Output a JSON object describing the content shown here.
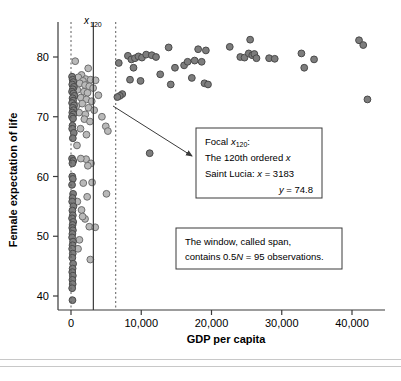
{
  "chart_data": {
    "type": "scatter",
    "title": "",
    "xlabel": "GDP per capita",
    "ylabel": "Female expectation of life",
    "xlim": [
      -2500,
      45500
    ],
    "ylim": [
      37.5,
      84
    ],
    "xticks": [
      0,
      10000,
      20000,
      30000,
      40000
    ],
    "xticklabels": [
      "0",
      "10,000",
      "20,000",
      "30,000",
      "40,000"
    ],
    "yticks": [
      40,
      50,
      60,
      70,
      80
    ],
    "yticklabels": [
      "40",
      "50",
      "60",
      "70",
      "80"
    ],
    "grid": false,
    "legend": "none",
    "focal_line_label": "x120",
    "focal_line_x": 3183,
    "span_lower_x": 0,
    "span_upper_x": 6366,
    "series": [
      {
        "name": "inside-span",
        "marker": "circle",
        "fill": "#b9b9b9",
        "edge": "#6e6e6e",
        "points": [
          [
            600,
            79.3
          ],
          [
            2450,
            78.1
          ],
          [
            1500,
            77.0
          ],
          [
            1050,
            76.6
          ],
          [
            2100,
            76.3
          ],
          [
            1700,
            76.0
          ],
          [
            2800,
            76.2
          ],
          [
            3500,
            76.1
          ],
          [
            1250,
            75.6
          ],
          [
            2000,
            75.3
          ],
          [
            2600,
            75.1
          ],
          [
            3150,
            74.8
          ],
          [
            900,
            74.5
          ],
          [
            1850,
            74.2
          ],
          [
            2350,
            74.0
          ],
          [
            3900,
            73.6
          ],
          [
            1400,
            73.2
          ],
          [
            2200,
            72.9
          ],
          [
            2950,
            72.6
          ],
          [
            1600,
            72.2
          ],
          [
            750,
            71.8
          ],
          [
            2500,
            71.5
          ],
          [
            3300,
            71.1
          ],
          [
            1150,
            70.7
          ],
          [
            2050,
            70.4
          ],
          [
            4400,
            70.0
          ],
          [
            1900,
            69.6
          ],
          [
            2700,
            69.2
          ],
          [
            4950,
            68.4
          ],
          [
            1350,
            68.0
          ],
          [
            5250,
            67.6
          ],
          [
            850,
            65.2
          ],
          [
            2150,
            62.9
          ],
          [
            2850,
            62.2
          ],
          [
            2400,
            61.8
          ],
          [
            1750,
            58.9
          ],
          [
            2300,
            56.6
          ],
          [
            5050,
            57.1
          ],
          [
            1500,
            54.4
          ],
          [
            2000,
            52.9
          ],
          [
            2600,
            51.6
          ],
          [
            3450,
            51.5
          ],
          [
            1200,
            49.4
          ],
          [
            2750,
            46.1
          ],
          [
            1000,
            47.9
          ],
          [
            1650,
            53.3
          ],
          [
            900,
            55.8
          ],
          [
            3000,
            59.0
          ],
          [
            1400,
            63.0
          ],
          [
            2200,
            67.0
          ]
        ]
      },
      {
        "name": "outside-span",
        "marker": "circle",
        "fill": "#7d7d7d",
        "edge": "#4a4a4a",
        "points": [
          [
            150,
            76.7
          ],
          [
            230,
            76.2
          ],
          [
            320,
            75.8
          ],
          [
            180,
            75.4
          ],
          [
            410,
            75.0
          ],
          [
            260,
            74.6
          ],
          [
            150,
            74.2
          ],
          [
            350,
            73.9
          ],
          [
            480,
            73.5
          ],
          [
            220,
            73.1
          ],
          [
            300,
            72.7
          ],
          [
            160,
            72.3
          ],
          [
            430,
            71.9
          ],
          [
            250,
            71.5
          ],
          [
            370,
            71.1
          ],
          [
            190,
            70.7
          ],
          [
            330,
            70.4
          ],
          [
            140,
            70.0
          ],
          [
            290,
            69.7
          ],
          [
            210,
            68.5
          ],
          [
            170,
            68.0
          ],
          [
            400,
            67.3
          ],
          [
            260,
            66.4
          ],
          [
            150,
            63.0
          ],
          [
            320,
            62.6
          ],
          [
            200,
            62.2
          ],
          [
            180,
            60.0
          ],
          [
            260,
            59.6
          ],
          [
            150,
            58.6
          ],
          [
            300,
            57.1
          ],
          [
            220,
            56.4
          ],
          [
            170,
            55.8
          ],
          [
            340,
            55.0
          ],
          [
            200,
            54.3
          ],
          [
            260,
            53.5
          ],
          [
            150,
            53.0
          ],
          [
            310,
            52.4
          ],
          [
            230,
            51.9
          ],
          [
            180,
            51.4
          ],
          [
            270,
            51.0
          ],
          [
            200,
            50.4
          ],
          [
            160,
            49.8
          ],
          [
            290,
            49.1
          ],
          [
            220,
            48.5
          ],
          [
            170,
            47.9
          ],
          [
            250,
            47.1
          ],
          [
            190,
            46.4
          ],
          [
            300,
            45.4
          ],
          [
            230,
            44.6
          ],
          [
            180,
            44.0
          ],
          [
            260,
            43.4
          ],
          [
            200,
            42.7
          ],
          [
            240,
            42.0
          ],
          [
            170,
            41.3
          ],
          [
            210,
            39.3
          ],
          [
            6800,
            79.0
          ],
          [
            7300,
            73.8
          ],
          [
            6950,
            73.5
          ],
          [
            6600,
            73.3
          ],
          [
            8100,
            80.2
          ],
          [
            8600,
            79.6
          ],
          [
            8900,
            78.2
          ],
          [
            9100,
            79.8
          ],
          [
            8400,
            76.2
          ],
          [
            9600,
            80.1
          ],
          [
            10100,
            79.9
          ],
          [
            9900,
            76.0
          ],
          [
            11200,
            63.9
          ],
          [
            10700,
            80.4
          ],
          [
            11500,
            80.3
          ],
          [
            12100,
            80.0
          ],
          [
            12700,
            77.1
          ],
          [
            13900,
            81.6
          ],
          [
            14200,
            75.4
          ],
          [
            14800,
            78.2
          ],
          [
            16100,
            78.6
          ],
          [
            16600,
            79.2
          ],
          [
            17200,
            76.5
          ],
          [
            17600,
            79.4
          ],
          [
            18100,
            81.3
          ],
          [
            18600,
            79.2
          ],
          [
            19200,
            81.1
          ],
          [
            19000,
            75.6
          ],
          [
            19500,
            75.4
          ],
          [
            22600,
            81.7
          ],
          [
            24100,
            80.0
          ],
          [
            24700,
            79.9
          ],
          [
            25300,
            80.6
          ],
          [
            25500,
            82.9
          ],
          [
            25800,
            80.3
          ],
          [
            26100,
            80.5
          ],
          [
            26400,
            79.8
          ],
          [
            28200,
            79.8
          ],
          [
            29000,
            79.7
          ],
          [
            32800,
            80.6
          ],
          [
            33200,
            78.2
          ],
          [
            34600,
            79.6
          ],
          [
            41000,
            82.8
          ],
          [
            41600,
            82.0
          ],
          [
            42200,
            72.9
          ]
        ]
      }
    ],
    "annotations": [
      {
        "name": "focal-box",
        "lines": [
          "Focal x120:",
          "The 120th ordered x",
          "Saint Lucia: x = 3183",
          "y = 74.8"
        ]
      },
      {
        "name": "span-box",
        "lines": [
          "The window, called span,",
          "contains 0.5N = 95 observations."
        ]
      }
    ]
  },
  "labels": {
    "focal_marker": "x",
    "focal_marker_sub": "120",
    "focal_line1_pre": "Focal ",
    "focal_line1_italic": "x",
    "focal_line1_sub": "120",
    "focal_line1_post": ":",
    "focal_line2_pre": "The 120th ordered ",
    "focal_line2_italic": "x",
    "focal_line3_pre": "Saint Lucia: ",
    "focal_line3_italic": "x",
    "focal_line3_post": " = 3183",
    "focal_line4_italic": "y",
    "focal_line4_post": " = 74.8",
    "span_line1": "The window, called span,",
    "span_line2_pre": "contains 0.5",
    "span_line2_italic": "N",
    "span_line2_post": " = 95 observations."
  },
  "colors": {
    "marker_dark_fill": "#7d7d7d",
    "marker_dark_edge": "#4a4a4a",
    "marker_light_fill": "#b9b9b9",
    "marker_light_edge": "#6e6e6e",
    "axis": "#3a3a3a",
    "dashed_line": "#5a5a5a",
    "solid_line": "#3a3a3a",
    "box_border": "#3a3a3a",
    "footer_rule": "#c8c8c8"
  }
}
